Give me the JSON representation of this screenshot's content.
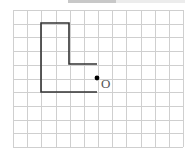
{
  "diagram": {
    "type": "grid-figure",
    "grid": {
      "x0": 13,
      "y0": 10,
      "cols": 12,
      "rows": 10,
      "cell_w": 14.17,
      "cell_h": 13.7,
      "line_color": "#c9c9c9"
    },
    "shape": {
      "name": "L-shape",
      "stroke": "#333333",
      "polyline": [
        [
          97,
          64
        ],
        [
          69,
          64
        ],
        [
          69,
          23
        ],
        [
          41,
          23
        ],
        [
          41,
          92
        ],
        [
          97,
          92
        ]
      ]
    },
    "point": {
      "label": "O",
      "x": 97,
      "y": 78,
      "color": "#000000"
    }
  }
}
